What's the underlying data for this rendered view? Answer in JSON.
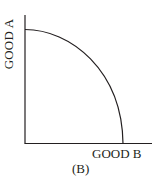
{
  "diagram": {
    "type": "production-possibilities-frontier",
    "y_axis_label": "GOOD A",
    "x_axis_label": "GOOD B",
    "caption": "(B)",
    "curve": "concave (bowed outward) curve from y-axis intercept to x-axis intercept",
    "line_color": "#231f20"
  }
}
